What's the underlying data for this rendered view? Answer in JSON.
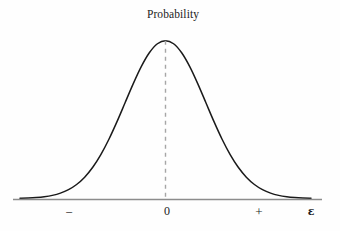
{
  "figure": {
    "background_color": "#fefefe",
    "title": "Probability",
    "axis_label": "ε",
    "curve_color": "#1a1a1a",
    "axis_color": "#8c8c8c",
    "dash_color": "#a6a6a6"
  },
  "ticks": {
    "negative": "−",
    "zero": "0",
    "positive": "+"
  },
  "chart_data": {
    "type": "line",
    "title": "Probability",
    "xlabel": "ε",
    "ylabel": "Probability",
    "subtitle": "",
    "grid": false,
    "legend": null,
    "annotations": [
      {
        "text": "Probability",
        "x": 0,
        "y": 1.0,
        "note": "label above the peak of the distribution"
      },
      {
        "text": "dashed vertical line at mean",
        "x": 0,
        "y_from": 0,
        "y_to": 1.0
      }
    ],
    "xlim": [
      -3.6,
      3.6
    ],
    "ylim": [
      0,
      1.08
    ],
    "xticks": [
      -1.7,
      0,
      1.6
    ],
    "xticklabels": [
      "−",
      "0",
      "+"
    ],
    "yticks": [],
    "yticklabels": [],
    "series": [
      {
        "name": "Probability density",
        "x": [
          -3.6,
          -3.4,
          -3.2,
          -3.0,
          -2.8,
          -2.6,
          -2.4,
          -2.2,
          -2.0,
          -1.8,
          -1.6,
          -1.4,
          -1.2,
          -1.0,
          -0.8,
          -0.6,
          -0.4,
          -0.2,
          0.0,
          0.2,
          0.4,
          0.6,
          0.8,
          1.0,
          1.2,
          1.4,
          1.6,
          1.8,
          2.0,
          2.2,
          2.4,
          2.6,
          2.8,
          3.0,
          3.2,
          3.4,
          3.6
        ],
        "y": [
          0.0015,
          0.0031,
          0.006,
          0.0111,
          0.0198,
          0.034,
          0.0561,
          0.0889,
          0.1353,
          0.1979,
          0.278,
          0.3753,
          0.4868,
          0.6065,
          0.7261,
          0.8353,
          0.9231,
          0.9802,
          1.0,
          0.9802,
          0.9231,
          0.8353,
          0.7261,
          0.6065,
          0.4868,
          0.3753,
          0.278,
          0.1979,
          0.1353,
          0.0889,
          0.0561,
          0.034,
          0.0198,
          0.0111,
          0.006,
          0.0031,
          0.0015
        ]
      }
    ]
  }
}
